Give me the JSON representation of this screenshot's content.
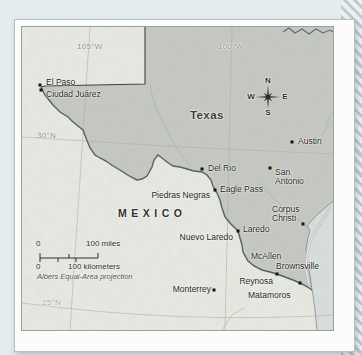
{
  "figure": {
    "region_labels": {
      "state": "Texas",
      "country": "MEXICO"
    },
    "graticule_labels": {
      "lon_105w": "105°W",
      "lon_100w": "100°W",
      "lat_30n": "30°N",
      "lat_25n": "25°N"
    },
    "compass": {
      "north": "N",
      "east": "E",
      "south": "S",
      "west": "W"
    },
    "scale_bar": {
      "miles_zero": "0",
      "miles_max": "100 miles",
      "km_zero": "0",
      "km_max": "100 kilometers",
      "projection_note": "Albers Equal-Area projection"
    },
    "cities": [
      {
        "label": "El Paso"
      },
      {
        "label": "Ciudad Juárez"
      },
      {
        "label": "Del Rio"
      },
      {
        "label": "Eagle Pass"
      },
      {
        "label": "Piedras Negras"
      },
      {
        "label": "Austin"
      },
      {
        "label": "San Antonio"
      },
      {
        "label": "Corpus Christi"
      },
      {
        "label": "Laredo"
      },
      {
        "label": "Nuevo Laredo"
      },
      {
        "label": "McAllen"
      },
      {
        "label": "Brownsville"
      },
      {
        "label": "Reynosa"
      },
      {
        "label": "Matamoros"
      },
      {
        "label": "Monterrey"
      }
    ],
    "colors": {
      "texas_fill": "#c6c8c3",
      "land_fill": "#e9e9e4",
      "water_fill": "#d9dfdd",
      "river": "#4e5f66",
      "border": "#3b3b39",
      "graticule": "#b6ad9e",
      "frame": "#fcfcfa",
      "page_background": "#e3ecee",
      "stripe": "#bfcbcd"
    }
  }
}
